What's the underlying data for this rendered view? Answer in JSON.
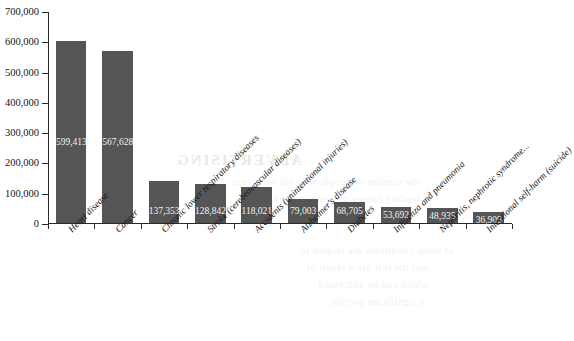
{
  "chart_data": {
    "type": "bar",
    "title": "",
    "subtitle": "",
    "xlabel": "",
    "ylabel": "",
    "grid": false,
    "legend": false,
    "ylim": [
      0,
      700000
    ],
    "ytick_step": 100000,
    "ytick_labels": [
      "0",
      "100,000",
      "200,000",
      "300,000",
      "400,000",
      "500,000",
      "600,000",
      "700,000"
    ],
    "ytick_values": [
      0,
      100000,
      200000,
      300000,
      400000,
      500000,
      600000,
      700000
    ],
    "bar_color": "#555555",
    "value_label_color": "#f2f2f2",
    "categories": [
      "Heart disease",
      "Cancer",
      "Chronic lower respiratory diseases",
      "Stroke (cerebrovascular diseases)",
      "Accidents (unintentional injuries)",
      "Alzheimer's disease",
      "Diabetes",
      "Influenza and pneumonia",
      "Nephritis, nephrotic syndrome...",
      "Intentional self-harm (suicide)"
    ],
    "values": [
      599413,
      567628,
      137353,
      128842,
      118021,
      79003,
      68705,
      53692,
      48935,
      36909
    ],
    "value_labels": [
      "599,413",
      "567,628",
      "137,353",
      "128,842",
      "118,021",
      "79,003",
      "68,705",
      "53,692",
      "48,935",
      "36,909"
    ]
  },
  "ghost_text": {
    "heading": "ADVERTISING",
    "lines": [
      "the number of people who die each year",
      "leading causes of death in the United",
      "of these conditions are related to",
      "and the rest are a result of",
      "which can be addressed",
      "a significant portion"
    ]
  }
}
